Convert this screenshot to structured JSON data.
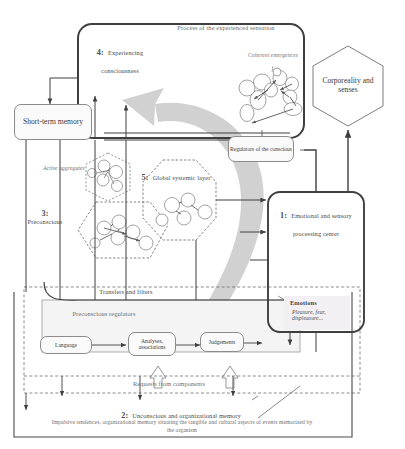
{
  "diagram": {
    "title_caption": "2: Unconscious and organizational memory",
    "subcaption": "Impulsive tendences, organizational memory situating the tangible and cultural aspects of events memorized by the organism",
    "colors": {
      "line": "#4a4a4a",
      "light_line": "#8c8c8c",
      "arrow_fill": "#bdbdbd",
      "text": "#4a4a4a",
      "box_fill": "#fafafa"
    }
  },
  "nodes": {
    "experiencing_consciousness": {
      "number": "4:",
      "label": "Experiencing consciousness"
    },
    "process_sensation": {
      "label": "Process of the experienced sensation"
    },
    "coherent_emergences": {
      "label": "Coherent emergences"
    },
    "corporeality": {
      "label": "Corporeality and senses"
    },
    "short_term_memory": {
      "label": "Short-term memory"
    },
    "active_aggregates": {
      "label": "Active aggregates"
    },
    "global_systemic_layer": {
      "number": "5:",
      "label": "Global systemic layer"
    },
    "preconscious": {
      "number": "3:",
      "label": "Preconscious"
    },
    "regulators_conscious": {
      "label": "Regulators of the conscious"
    },
    "emotional_center": {
      "number": "1:",
      "label": "Emotional and sensory processing center"
    },
    "emotions": {
      "label": "Emotions",
      "detail": "Pleasure, fear, displeasure..."
    },
    "transfers_filters": {
      "label": "Transfers and filters"
    },
    "preconscious_regulators": {
      "label": "Preconscious regulators"
    },
    "language": {
      "label": "Language"
    },
    "analyses": {
      "label": "Analyses, associations"
    },
    "judgements": {
      "label": "Judgements"
    },
    "requests_components": {
      "label": "Requests from components"
    }
  }
}
